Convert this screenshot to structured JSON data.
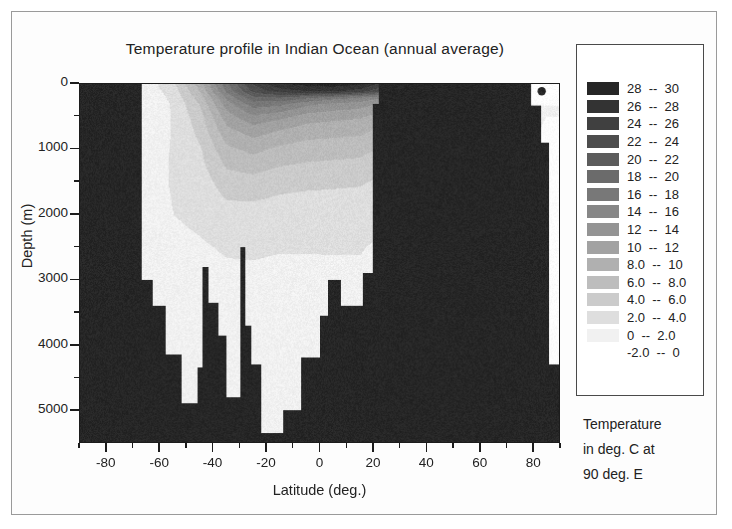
{
  "figure": {
    "title": "Temperature profile in Indian Ocean (annual average)",
    "background": "#ffffff"
  },
  "axes": {
    "x": {
      "title": "Latitude (deg.)",
      "ticks": [
        "-80",
        "-60",
        "-40",
        "-20",
        "0",
        "20",
        "40",
        "60",
        "80"
      ],
      "range": [
        -90,
        90
      ],
      "minor_step": 10
    },
    "y": {
      "title": "Depth (m)",
      "ticks": [
        "0",
        "1000",
        "2000",
        "3000",
        "4000",
        "5000"
      ],
      "range": [
        0,
        5500
      ],
      "inverted": true,
      "minor_step": 500
    }
  },
  "legend": {
    "caption_lines": [
      "Temperature",
      "in deg. C at",
      "90 deg. E"
    ],
    "entries": [
      {
        "label": "28  --  30",
        "low": 28,
        "high": 30,
        "color": "#262626"
      },
      {
        "label": "26  --  28",
        "low": 26,
        "high": 28,
        "color": "#333333"
      },
      {
        "label": "24  --  26",
        "low": 24,
        "high": 26,
        "color": "#404040"
      },
      {
        "label": "22  --  24",
        "low": 22,
        "high": 24,
        "color": "#4d4d4d"
      },
      {
        "label": "20  --  22",
        "low": 20,
        "high": 22,
        "color": "#5c5c5c"
      },
      {
        "label": "18  --  20",
        "low": 18,
        "high": 20,
        "color": "#6b6b6b"
      },
      {
        "label": "16  --  18",
        "low": 16,
        "high": 18,
        "color": "#787878"
      },
      {
        "label": "14  --  16",
        "low": 14,
        "high": 16,
        "color": "#878787"
      },
      {
        "label": "12  --  14",
        "low": 12,
        "high": 14,
        "color": "#949494"
      },
      {
        "label": "10  --  12",
        "low": 10,
        "high": 12,
        "color": "#a2a2a2"
      },
      {
        "label": "8.0  --  10",
        "low": 8,
        "high": 10,
        "color": "#b0b0b0"
      },
      {
        "label": "6.0  --  8.0",
        "low": 6,
        "high": 8,
        "color": "#bdbdbd"
      },
      {
        "label": "4.0  --  6.0",
        "low": 4,
        "high": 6,
        "color": "#cbcbcb"
      },
      {
        "label": "2.0  --  4.0",
        "low": 2,
        "high": 4,
        "color": "#dedede"
      },
      {
        "label": "0  --  2.0",
        "low": 0,
        "high": 2,
        "color": "#f1f1f1"
      },
      {
        "label": "-2.0  --  0",
        "low": -2,
        "high": 0,
        "color": "#ffffff"
      }
    ]
  },
  "chart_data": {
    "type": "heatmap",
    "title": "Temperature profile in Indian Ocean (annual average)",
    "xlabel": "Latitude (deg.)",
    "ylabel": "Depth (m)",
    "zlabel": "Temperature in deg. C at 90 deg. E",
    "xlim": [
      -90,
      90
    ],
    "ylim": [
      0,
      5500
    ],
    "y_inverted": true,
    "grid": false,
    "legend_position": "right",
    "colormap": "grayscale-reversed",
    "levels": [
      -2,
      0,
      2,
      4,
      6,
      8,
      10,
      12,
      14,
      16,
      18,
      20,
      22,
      24,
      26,
      28,
      30
    ],
    "mask_color": "#262626",
    "mask_note": "Dark regions are land / sea-floor (no data) mask",
    "x": [
      -90,
      -80,
      -70,
      -65,
      -60,
      -55,
      -50,
      -45,
      -40,
      -35,
      -30,
      -25,
      -20,
      -15,
      -10,
      -5,
      0,
      5,
      10,
      15,
      20,
      25,
      30,
      40,
      50,
      60,
      70,
      80,
      90
    ],
    "y": [
      0,
      100,
      200,
      300,
      500,
      700,
      1000,
      1500,
      2000,
      2500,
      3000,
      3500,
      4000,
      4500,
      5000,
      5500
    ],
    "sea_floor_depth": [
      {
        "lat": -90,
        "depth": 0
      },
      {
        "lat": -68,
        "depth": 0
      },
      {
        "lat": -67,
        "depth": 3000
      },
      {
        "lat": -63,
        "depth": 3400
      },
      {
        "lat": -60,
        "depth": 3400
      },
      {
        "lat": -58,
        "depth": 4150
      },
      {
        "lat": -52,
        "depth": 4900
      },
      {
        "lat": -48,
        "depth": 4900
      },
      {
        "lat": -46,
        "depth": 4350
      },
      {
        "lat": -44,
        "depth": 2800
      },
      {
        "lat": -42,
        "depth": 3350
      },
      {
        "lat": -38,
        "depth": 3850
      },
      {
        "lat": -35,
        "depth": 4800
      },
      {
        "lat": -32,
        "depth": 4800
      },
      {
        "lat": -30,
        "depth": 2500
      },
      {
        "lat": -28,
        "depth": 3700
      },
      {
        "lat": -26,
        "depth": 4300
      },
      {
        "lat": -22,
        "depth": 5350
      },
      {
        "lat": -16,
        "depth": 5350
      },
      {
        "lat": -14,
        "depth": 5000
      },
      {
        "lat": -9,
        "depth": 5000
      },
      {
        "lat": -7,
        "depth": 4200
      },
      {
        "lat": -4,
        "depth": 4200
      },
      {
        "lat": 0,
        "depth": 3550
      },
      {
        "lat": 3,
        "depth": 3000
      },
      {
        "lat": 6,
        "depth": 3000
      },
      {
        "lat": 8,
        "depth": 3400
      },
      {
        "lat": 12,
        "depth": 3400
      },
      {
        "lat": 16,
        "depth": 2900
      },
      {
        "lat": 20,
        "depth": 300
      },
      {
        "lat": 22,
        "depth": 0
      },
      {
        "lat": 80,
        "depth": 0
      },
      {
        "lat": 83,
        "depth": 900
      },
      {
        "lat": 86,
        "depth": 4300
      },
      {
        "lat": 90,
        "depth": 4300
      }
    ],
    "temperature_profiles": [
      {
        "lat": -65,
        "values": [
          1.0,
          0.8,
          0.5,
          0.3,
          0.2,
          0.2,
          0.5,
          0.8,
          0.6,
          0.4,
          0.2,
          0.0,
          -0.2,
          -0.4,
          -0.5,
          -0.5
        ]
      },
      {
        "lat": -55,
        "values": [
          3.5,
          3.0,
          2.6,
          2.3,
          2.2,
          2.2,
          2.3,
          2.3,
          2.0,
          1.5,
          1.0,
          0.6,
          0.3,
          0.1,
          0.0,
          0.0
        ]
      },
      {
        "lat": -45,
        "values": [
          9.0,
          8.2,
          7.0,
          6.2,
          5.2,
          4.6,
          3.8,
          3.0,
          2.4,
          1.8,
          1.3,
          0.9,
          0.6,
          0.4,
          0.3,
          0.3
        ]
      },
      {
        "lat": -35,
        "values": [
          17.5,
          16.5,
          14.5,
          13.0,
          11.0,
          9.5,
          7.5,
          5.0,
          3.2,
          2.2,
          1.6,
          1.2,
          0.9,
          0.7,
          0.6,
          0.6
        ]
      },
      {
        "lat": -25,
        "values": [
          24.0,
          22.5,
          19.5,
          17.0,
          13.5,
          11.0,
          8.5,
          5.2,
          3.2,
          2.2,
          1.7,
          1.3,
          1.0,
          0.8,
          0.7,
          0.7
        ]
      },
      {
        "lat": -15,
        "values": [
          27.5,
          25.0,
          20.0,
          16.5,
          12.5,
          10.0,
          7.5,
          4.6,
          3.0,
          2.1,
          1.6,
          1.3,
          1.0,
          0.8,
          0.7,
          0.7
        ]
      },
      {
        "lat": -5,
        "values": [
          28.5,
          26.0,
          18.5,
          14.5,
          11.0,
          9.0,
          7.0,
          4.4,
          2.9,
          2.1,
          1.6,
          1.3,
          1.0,
          0.9,
          0.8,
          0.8
        ]
      },
      {
        "lat": 5,
        "values": [
          28.8,
          26.5,
          17.0,
          13.5,
          10.5,
          8.8,
          6.8,
          4.3,
          2.9,
          2.1,
          1.7,
          1.4,
          1.1,
          1.0,
          0.9,
          0.9
        ]
      },
      {
        "lat": 15,
        "values": [
          28.2,
          25.0,
          16.0,
          13.0,
          10.2,
          8.6,
          6.6,
          4.2,
          2.8,
          2.1,
          1.7,
          1.4,
          1.2,
          1.0,
          1.0,
          1.0
        ]
      },
      {
        "lat": 85,
        "values": [
          1.5,
          1.0,
          0.5,
          0.2,
          0.0,
          -0.3,
          -0.6,
          -0.8,
          -0.9,
          -0.9,
          -0.9,
          -0.9,
          -0.9,
          -0.9,
          -0.9,
          -0.9
        ]
      }
    ]
  }
}
